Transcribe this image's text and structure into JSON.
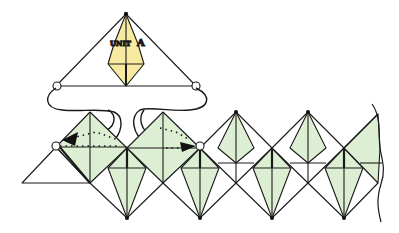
{
  "diagram": {
    "type": "origami-assembly",
    "unit_label_prefix": "UNIT",
    "unit_label_letter": "A",
    "colors": {
      "unit_a_fill": "#f6eaa0",
      "chain_fill": "#dcefd2",
      "line": "#1a1a1a",
      "arrow": "#111111"
    },
    "elements": [
      "Unit A (yellow kite inside triangle) shown above the chain",
      "Curved lines link corner circles of Unit A to insertion points on the chain",
      "Two black arrows with dotted paths show the corners being inserted",
      "Repeating chain of green diamond units, wavy break line at right edge"
    ]
  }
}
